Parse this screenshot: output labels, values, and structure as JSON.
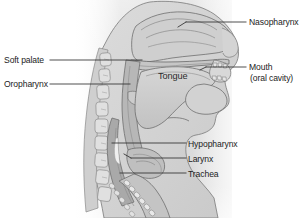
{
  "figure": {
    "type": "anatomical-sagittal-section",
    "style": "grayscale line drawing",
    "background_color": "#ffffff",
    "shading_color": "#d9d9d9",
    "outline_color": "#6e6e6e",
    "text_color": "#1c1c1c",
    "leader_line_color": "#3a3a3a",
    "width": 303,
    "height": 218
  },
  "labels": {
    "nasopharynx": "Nasopharynx",
    "soft_palate": "Soft palate",
    "oropharynx": "Oropharynx",
    "tongue": "Tongue",
    "mouth": "Mouth",
    "mouth_sub": "(oral cavity)",
    "hypopharynx": "Hypopharynx",
    "larynx": "Larynx",
    "trachea": "Trachea"
  },
  "structures": [
    {
      "name": "nasal-cavity",
      "label": "Nasopharynx"
    },
    {
      "name": "soft-palate",
      "label": "Soft palate"
    },
    {
      "name": "oropharynx",
      "label": "Oropharynx"
    },
    {
      "name": "tongue",
      "label": "Tongue"
    },
    {
      "name": "oral-cavity",
      "label": "Mouth (oral cavity)"
    },
    {
      "name": "hypopharynx",
      "label": "Hypopharynx"
    },
    {
      "name": "larynx",
      "label": "Larynx"
    },
    {
      "name": "trachea",
      "label": "Trachea"
    },
    {
      "name": "cervical-vertebrae",
      "label": ""
    },
    {
      "name": "mandible",
      "label": ""
    }
  ]
}
